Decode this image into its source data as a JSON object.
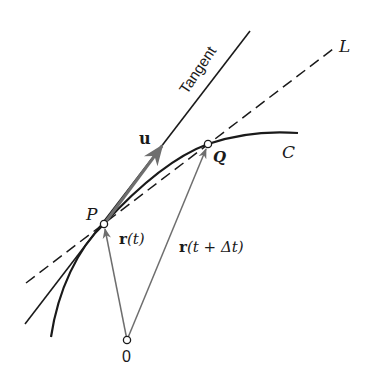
{
  "figure": {
    "labels": {
      "tangent": "Tangent",
      "line_L": "L",
      "curve_C": "C",
      "point_P": "P",
      "point_Q": "Q",
      "origin": "0",
      "unit_vector": "u",
      "r_t_bold": "r",
      "r_t_arg": "(t)",
      "r_tdt_bold": "r",
      "r_tdt_arg": "(t + Δt)"
    },
    "colors": {
      "ink": "#1a1a1a",
      "vector": "#6e6e6e",
      "background": "#ffffff"
    }
  }
}
